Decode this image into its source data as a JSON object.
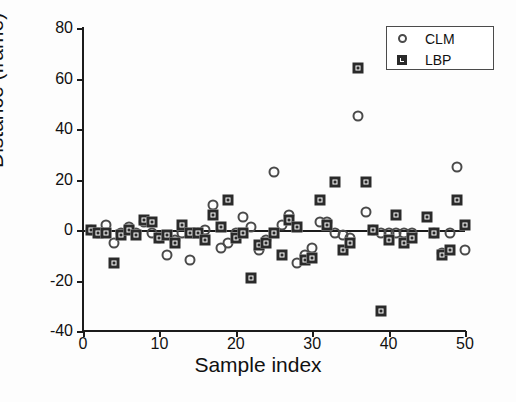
{
  "chart_data": {
    "type": "scatter",
    "title": "",
    "xlabel": "Sample index",
    "ylabel": "Distance  (frame)",
    "xlim": [
      0,
      50
    ],
    "ylim": [
      -40,
      80
    ],
    "xticks": [
      0,
      10,
      20,
      30,
      40,
      50
    ],
    "yticks": [
      -40,
      -20,
      0,
      20,
      40,
      60,
      80
    ],
    "grid": false,
    "legend_position": "top-right",
    "reference_line_y": 0,
    "series": [
      {
        "name": "CLM",
        "marker": "circle",
        "color": "#4a4a4a",
        "points": [
          [
            1,
            0
          ],
          [
            2,
            -1
          ],
          [
            3,
            2
          ],
          [
            4,
            -5
          ],
          [
            5,
            -1
          ],
          [
            6,
            1
          ],
          [
            7,
            -1
          ],
          [
            8,
            3
          ],
          [
            9,
            -1
          ],
          [
            10,
            -3
          ],
          [
            11,
            -10
          ],
          [
            12,
            -4
          ],
          [
            13,
            -1
          ],
          [
            14,
            -12
          ],
          [
            15,
            -1
          ],
          [
            16,
            0
          ],
          [
            17,
            10
          ],
          [
            18,
            -7
          ],
          [
            19,
            -5
          ],
          [
            20,
            -1
          ],
          [
            21,
            5
          ],
          [
            22,
            1
          ],
          [
            23,
            -8
          ],
          [
            24,
            -4
          ],
          [
            25,
            23
          ],
          [
            26,
            2
          ],
          [
            27,
            6
          ],
          [
            28,
            -13
          ],
          [
            29,
            -10
          ],
          [
            30,
            -7
          ],
          [
            31,
            3
          ],
          [
            32,
            3
          ],
          [
            33,
            -1
          ],
          [
            34,
            -2
          ],
          [
            35,
            -3
          ],
          [
            36,
            45
          ],
          [
            37,
            7
          ],
          [
            38,
            0
          ],
          [
            39,
            -1
          ],
          [
            40,
            -1
          ],
          [
            41,
            -1
          ],
          [
            42,
            -1
          ],
          [
            43,
            -1
          ],
          [
            46,
            -1
          ],
          [
            47,
            -9
          ],
          [
            48,
            -1
          ],
          [
            49,
            25
          ],
          [
            50,
            -8
          ]
        ]
      },
      {
        "name": "LBP",
        "marker": "square",
        "color": "#2a2a2a",
        "points": [
          [
            1,
            0
          ],
          [
            2,
            -1
          ],
          [
            3,
            -1
          ],
          [
            4,
            -13
          ],
          [
            5,
            -2
          ],
          [
            6,
            0
          ],
          [
            7,
            -2
          ],
          [
            8,
            4
          ],
          [
            9,
            3
          ],
          [
            10,
            -3
          ],
          [
            11,
            -2
          ],
          [
            12,
            -5
          ],
          [
            13,
            2
          ],
          [
            14,
            -1
          ],
          [
            15,
            -1
          ],
          [
            16,
            -4
          ],
          [
            17,
            6
          ],
          [
            18,
            1
          ],
          [
            19,
            12
          ],
          [
            20,
            -3
          ],
          [
            21,
            -1
          ],
          [
            22,
            -19
          ],
          [
            23,
            -6
          ],
          [
            24,
            -5
          ],
          [
            25,
            -1
          ],
          [
            26,
            -10
          ],
          [
            27,
            4
          ],
          [
            28,
            1
          ],
          [
            29,
            -12
          ],
          [
            30,
            -11
          ],
          [
            31,
            12
          ],
          [
            32,
            2
          ],
          [
            33,
            19
          ],
          [
            34,
            -8
          ],
          [
            35,
            -5
          ],
          [
            36,
            64
          ],
          [
            37,
            19
          ],
          [
            38,
            0
          ],
          [
            39,
            -32
          ],
          [
            40,
            -4
          ],
          [
            41,
            6
          ],
          [
            42,
            -5
          ],
          [
            43,
            -3
          ],
          [
            45,
            5
          ],
          [
            46,
            -1
          ],
          [
            47,
            -10
          ],
          [
            48,
            -8
          ],
          [
            49,
            12
          ],
          [
            50,
            2
          ]
        ]
      }
    ]
  },
  "legend": {
    "entries": [
      {
        "label": "CLM",
        "marker": "circle-icon"
      },
      {
        "label": "LBP",
        "marker": "square-icon"
      }
    ]
  }
}
